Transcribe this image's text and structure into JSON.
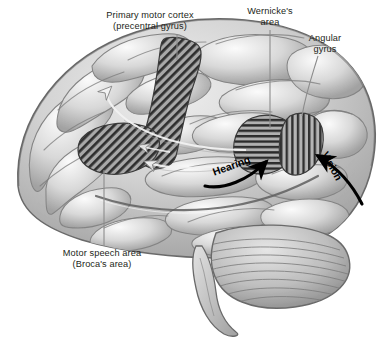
{
  "figure": {
    "background_color": "#ffffff",
    "text_color": "#231f20",
    "arrow_color": "#000000",
    "leader_color": "#8c8c8c"
  },
  "labels": {
    "primary_motor_cortex": "Primary motor cortex\n(precentral gyrus)",
    "wernickes_area": "Wernicke's\narea",
    "angular_gyrus": "Angular\ngyrus",
    "motor_speech_area": "Motor speech area\n(Broca's area)",
    "hearing": "Hearing",
    "vision": "Vision"
  },
  "regions": [
    {
      "name": "primary-motor-cortex",
      "label": "Primary motor cortex (precentral gyrus)",
      "hatch": "diagonal",
      "hatch_angle_deg": 45,
      "fill_color": "#9a9a9a"
    },
    {
      "name": "motor-speech-area",
      "label": "Motor speech area (Broca's area)",
      "hatch": "diagonal",
      "hatch_angle_deg": 45,
      "fill_color": "#9a9a9a"
    },
    {
      "name": "wernickes-area",
      "label": "Wernicke's area",
      "hatch": "horizontal",
      "hatch_angle_deg": 0,
      "fill_color": "#8e8e8e"
    },
    {
      "name": "angular-gyrus",
      "label": "Angular gyrus",
      "hatch": "vertical",
      "hatch_angle_deg": 90,
      "fill_color": "#9a9a9a"
    }
  ],
  "pathways": [
    {
      "name": "hearing-input-arrow",
      "label": "Hearing",
      "target": "Wernicke's area",
      "color": "#000000"
    },
    {
      "name": "vision-input-arrow",
      "label": "Vision",
      "target": "Angular gyrus",
      "color": "#000000"
    },
    {
      "name": "arcuate-fasciculus-arrow",
      "label": "",
      "target": "Broca's area",
      "color": "#f2f2f2"
    },
    {
      "name": "wernicke-to-motor-arrow",
      "label": "",
      "target": "Primary motor cortex",
      "color": "#f2f2f2"
    }
  ],
  "anatomy": [
    {
      "name": "cerebrum",
      "label": "Cerebrum"
    },
    {
      "name": "cerebellum",
      "label": "Cerebellum"
    },
    {
      "name": "brainstem",
      "label": "Brainstem"
    }
  ]
}
